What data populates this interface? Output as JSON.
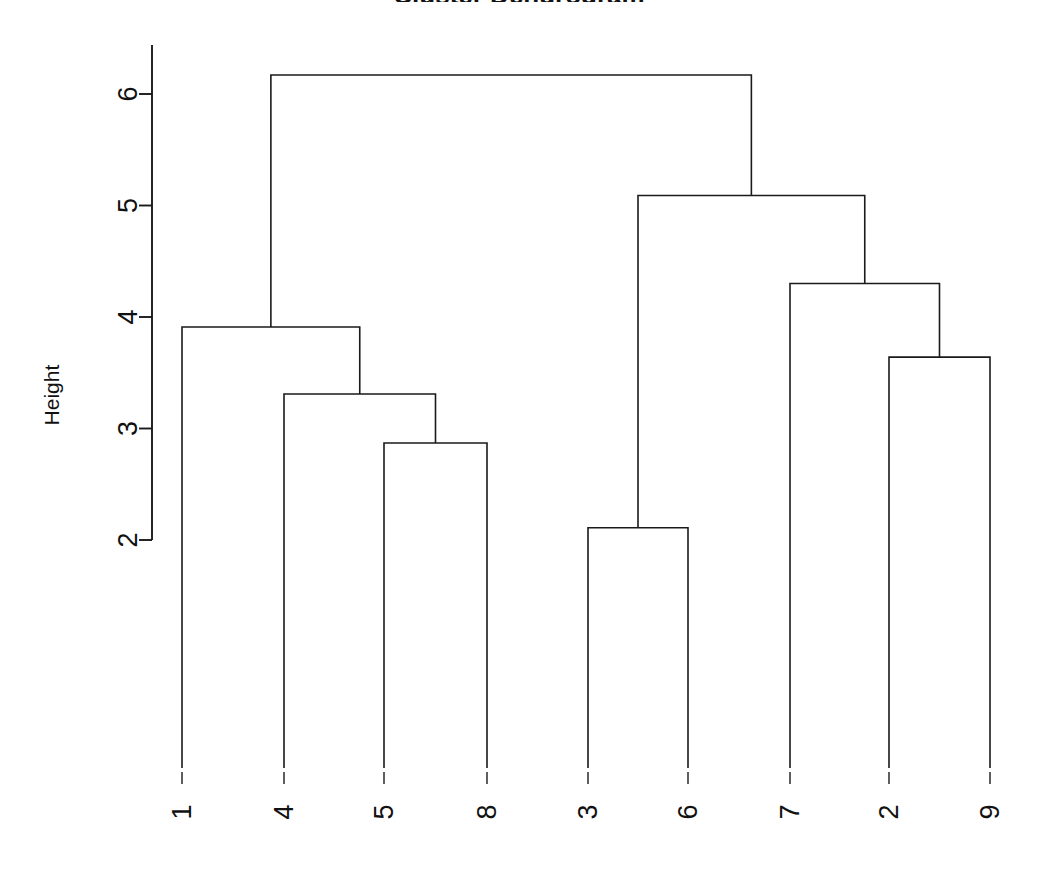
{
  "figure": {
    "title": "Cluster Dendrogram",
    "title_visible_fragment": "g",
    "background_color": "#ffffff",
    "line_color": "#1a1a1a",
    "text_color": "#111111"
  },
  "axes": {
    "y_axis": {
      "label": "Height",
      "label_rotation_deg": -90,
      "tick_labels": [
        "2",
        "3",
        "4",
        "5",
        "6"
      ],
      "tick_values": [
        2,
        3,
        4,
        5,
        6
      ],
      "tick_label_rotation_deg": -90,
      "range": [
        2,
        6
      ],
      "grid": "off",
      "spine_visible": true
    },
    "x_axis": {
      "label": "",
      "tick_labels": [
        "1",
        "4",
        "5",
        "8",
        "3",
        "6",
        "7",
        "2",
        "9"
      ],
      "tick_label_rotation_deg": -90,
      "spine_visible": false
    }
  },
  "chart_data": {
    "type": "dendrogram",
    "title": "Cluster Dendrogram",
    "xlabel": "",
    "ylabel": "Height",
    "ylim": [
      2.0,
      6.3
    ],
    "grid": false,
    "legend_position": "none",
    "leaf_order": [
      "1",
      "4",
      "5",
      "8",
      "3",
      "6",
      "7",
      "2",
      "9"
    ],
    "leaf_count": 9,
    "y_tick_values": [
      2,
      3,
      4,
      5,
      6
    ],
    "merges": [
      {
        "id": "m1",
        "label": "(3,6)",
        "members": [
          "3",
          "6"
        ],
        "height": 2.11,
        "left": "3",
        "right": "6"
      },
      {
        "id": "m2",
        "label": "(5,8)",
        "members": [
          "5",
          "8"
        ],
        "height": 2.87,
        "left": "5",
        "right": "8"
      },
      {
        "id": "m3",
        "label": "4+(5,8)",
        "members": [
          "4",
          "5",
          "8"
        ],
        "height": 3.31,
        "left": "4",
        "right": "m2"
      },
      {
        "id": "m4",
        "label": "(2,9)",
        "members": [
          "2",
          "9"
        ],
        "height": 3.64,
        "left": "2",
        "right": "9"
      },
      {
        "id": "m5",
        "label": "1+(4,5,8)",
        "members": [
          "1",
          "4",
          "5",
          "8"
        ],
        "height": 3.91,
        "left": "1",
        "right": "m3"
      },
      {
        "id": "m6",
        "label": "7+(2,9)",
        "members": [
          "7",
          "2",
          "9"
        ],
        "height": 4.3,
        "left": "7",
        "right": "m4"
      },
      {
        "id": "m7",
        "label": "(3,6)+(7,2,9)",
        "members": [
          "3",
          "6",
          "7",
          "2",
          "9"
        ],
        "height": 5.09,
        "left": "m1",
        "right": "m6"
      },
      {
        "id": "m8",
        "label": "root",
        "members": [
          "1",
          "4",
          "5",
          "8",
          "3",
          "6",
          "7",
          "2",
          "9"
        ],
        "height": 6.17,
        "left": "m5",
        "right": "m7"
      }
    ],
    "merge_heights": [
      2.11,
      2.87,
      3.31,
      3.64,
      3.91,
      4.3,
      5.09,
      6.17
    ]
  },
  "geometry": {
    "note": "pixel coordinates used to draw the figure",
    "leaf_x": [
      182,
      284,
      384,
      487,
      588,
      688,
      790,
      889,
      990
    ],
    "y_at_value_2": 540,
    "y_at_value_6": 94,
    "pixels_per_unit": 111.5,
    "axis_spine_x": 152,
    "axis_spine_top_y": 45,
    "axis_spine_bottom_y": 540,
    "leaf_base_y": 768
  }
}
